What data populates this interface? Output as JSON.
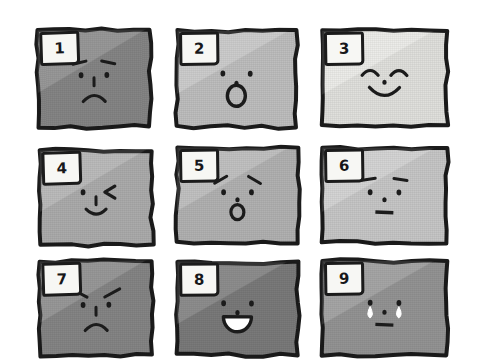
{
  "artwork": {
    "title": "Hand-drawn grid of nine numbered expression panels",
    "medium": "ink sketch with flat gray tones",
    "grid": {
      "rows": 3,
      "columns": 3,
      "panel_count": 9
    },
    "ink_color": "#1b1b1b",
    "tab_color": "#f7f7f4",
    "background_color": "#ffffff"
  },
  "panels": [
    {
      "number": "1",
      "label": "panel-1",
      "expression": "sad-frown",
      "fill": "#8b8b8b",
      "x": 38,
      "y": 30,
      "w": 112,
      "h": 97,
      "skew": -0.6,
      "features": {
        "eyebrow_left": true,
        "eyebrow_right": true,
        "eye_left": "dot",
        "eye_right": "dot",
        "nose": "tick",
        "mouth": "frown",
        "tears": false
      }
    },
    {
      "number": "2",
      "label": "panel-2",
      "expression": "surprised-oh",
      "fill": "#c6c6c6",
      "x": 177,
      "y": 31,
      "w": 119,
      "h": 96,
      "skew": 0.5,
      "features": {
        "eyebrow_left": false,
        "eyebrow_right": false,
        "eye_left": "dot",
        "eye_right": "dot",
        "nose": "dot",
        "mouth": "o-ring",
        "tears": false
      }
    },
    {
      "number": "3",
      "label": "panel-3",
      "expression": "happy-smile",
      "fill": "#eaeae6",
      "x": 322,
      "y": 31,
      "w": 125,
      "h": 94,
      "skew": 0.3,
      "features": {
        "eyebrow_left": false,
        "eyebrow_right": false,
        "eye_left": "arc",
        "eye_right": "arc",
        "nose": "dot",
        "mouth": "smile",
        "tears": false
      }
    },
    {
      "number": "4",
      "label": "panel-4",
      "expression": "winking",
      "fill": "#b3b3b3",
      "x": 40,
      "y": 150,
      "w": 112,
      "h": 95,
      "skew": -0.4,
      "features": {
        "eyebrow_left": false,
        "eyebrow_right": false,
        "eye_left": "dot",
        "eye_right": "wink-chevron",
        "nose": "tick",
        "mouth": "small-smile",
        "tears": false
      }
    },
    {
      "number": "5",
      "label": "panel-5",
      "expression": "worried-oh",
      "fill": "#b9b9b9",
      "x": 177,
      "y": 148,
      "w": 121,
      "h": 95,
      "skew": 0.4,
      "features": {
        "eyebrow_left": true,
        "eyebrow_right": true,
        "eye_left": "dot",
        "eye_right": "dot",
        "nose": "dot",
        "mouth": "small-o-ring",
        "tears": false
      }
    },
    {
      "number": "6",
      "label": "panel-6",
      "expression": "neutral-deadpan",
      "fill": "#cfcfcf",
      "x": 322,
      "y": 148,
      "w": 125,
      "h": 95,
      "skew": 0.4,
      "features": {
        "eyebrow_left": true,
        "eyebrow_right": true,
        "eye_left": "dot",
        "eye_right": "dot",
        "nose": "dot",
        "mouth": "flat-line",
        "tears": false
      }
    },
    {
      "number": "7",
      "label": "panel-7",
      "expression": "angry-frown",
      "fill": "#8b8b8b",
      "x": 40,
      "y": 261,
      "w": 112,
      "h": 94,
      "skew": -0.5,
      "features": {
        "eyebrow_left": true,
        "eyebrow_right": true,
        "eye_left": "dot",
        "eye_right": "dot",
        "nose": "tick",
        "mouth": "frown",
        "tears": false
      }
    },
    {
      "number": "8",
      "label": "panel-8",
      "expression": "laughing-open-mouth",
      "fill": "#7f7f7f",
      "x": 177,
      "y": 262,
      "w": 121,
      "h": 93,
      "skew": 0.5,
      "features": {
        "eyebrow_left": false,
        "eyebrow_right": false,
        "eye_left": "dot",
        "eye_right": "dot",
        "nose": "dot",
        "mouth": "open-grin",
        "tears": false
      }
    },
    {
      "number": "9",
      "label": "panel-9",
      "expression": "crying",
      "fill": "#9a9a9a",
      "x": 322,
      "y": 261,
      "w": 125,
      "h": 94,
      "skew": 0.4,
      "features": {
        "eyebrow_left": false,
        "eyebrow_right": false,
        "eye_left": "dot",
        "eye_right": "dot",
        "nose": "dot",
        "mouth": "flat-line",
        "tears": true
      }
    }
  ]
}
